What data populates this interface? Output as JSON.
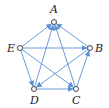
{
  "diagram": {
    "type": "directed-graph",
    "edge_color": "#5b8fd6",
    "node_color": "#333333",
    "nodes": [
      {
        "id": "A",
        "label": "A",
        "x": 54,
        "y": 22,
        "lx": 50,
        "ly": 13
      },
      {
        "id": "B",
        "label": "B",
        "x": 90,
        "y": 48,
        "lx": 95,
        "ly": 52
      },
      {
        "id": "C",
        "label": "C",
        "x": 76,
        "y": 89,
        "lx": 72,
        "ly": 104
      },
      {
        "id": "D",
        "label": "D",
        "x": 34,
        "y": 89,
        "lx": 30,
        "ly": 104
      },
      {
        "id": "E",
        "label": "E",
        "x": 20,
        "y": 48,
        "lx": 7,
        "ly": 52
      }
    ],
    "edges": [
      {
        "from": "E",
        "to": "A"
      },
      {
        "from": "B",
        "to": "A"
      },
      {
        "from": "C",
        "to": "A"
      },
      {
        "from": "D",
        "to": "A"
      },
      {
        "from": "E",
        "to": "B"
      },
      {
        "from": "E",
        "to": "C"
      },
      {
        "from": "E",
        "to": "D"
      },
      {
        "from": "B",
        "to": "D"
      },
      {
        "from": "D",
        "to": "C"
      },
      {
        "from": "C",
        "to": "B"
      }
    ]
  }
}
